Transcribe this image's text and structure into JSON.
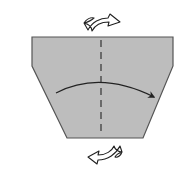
{
  "diagram": {
    "type": "origami-step",
    "paper": {
      "fill": "#bdbdbd",
      "stroke": "#555555",
      "shape": "trapezoid-with-shoulders"
    },
    "fold_line": {
      "style": "valley-dashed",
      "orientation": "vertical",
      "color": "#333333"
    },
    "fold_arrow": {
      "direction": "left-to-right",
      "color": "#222222"
    },
    "turn_over_symbols": [
      {
        "position": "top",
        "meaning": "turn-over"
      },
      {
        "position": "bottom",
        "meaning": "turn-over"
      }
    ]
  }
}
